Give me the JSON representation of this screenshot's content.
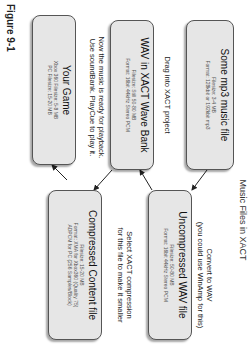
{
  "title": "Music Files in XACT",
  "boxes": {
    "mp3": {
      "heading": "Some mp3 music file",
      "lines": [
        "Filesize: 3-4 MB",
        "Format: 128kbit or 192kbit mp3"
      ]
    },
    "wav": {
      "heading": "Uncompressed WAV file",
      "lines": [
        "Filesize: 50-80 MB",
        "Format: 16bit 44kHz Stereo PCM"
      ]
    },
    "wavebank": {
      "heading": "WAV in XACT Wave Bank",
      "lines": [
        "Filesize: Still 50-80 MB",
        "Format: 16bit 44kHz Stereo PCM"
      ]
    },
    "compressed": {
      "heading": "Compressed Content file",
      "lines": [
        "Filesize: 15-20 MB",
        "Format: XMA for Xbox360 (Quality 75)",
        "ADPCM for PC (256 Samples/Block)"
      ]
    },
    "game": {
      "heading": "Your Game",
      "lines": [
        "Xbox 360 Filesize: 5-8 MB",
        "PC Filesize: 15-20 MB"
      ]
    }
  },
  "notes": {
    "convert": [
      "Convert to WAV",
      "(you could use WinAmp for this)"
    ],
    "drag": [
      "Drag into XACT project"
    ],
    "select": [
      "Select XACT compression",
      "for this file to make it smaller"
    ],
    "playback": [
      "Now the music is ready for playback.",
      "Use soundBank. PlayCue to play it."
    ]
  },
  "figure_label": "Figure 9-1"
}
